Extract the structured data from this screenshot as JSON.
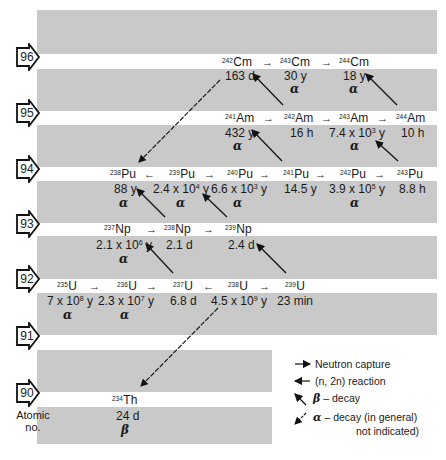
{
  "diagram": {
    "rows": [
      {
        "z": "96",
        "label_y": 43
      },
      {
        "z": "95",
        "label_y": 99
      },
      {
        "z": "94",
        "label_y": 155
      },
      {
        "z": "93",
        "label_y": 210
      },
      {
        "z": "92",
        "label_y": 265
      },
      {
        "z": "91",
        "label_y": 322
      },
      {
        "z": "90",
        "label_y": 379
      }
    ],
    "isotopes": {
      "cm242": {
        "mass": "242",
        "symbol": "Cm",
        "half_life": "163 d",
        "mode": ""
      },
      "cm243": {
        "mass": "243",
        "symbol": "Cm",
        "half_life": "30 y",
        "mode": "α"
      },
      "cm244": {
        "mass": "244",
        "symbol": "Cm",
        "half_life": "18 y",
        "mode": "α"
      },
      "am241": {
        "mass": "241",
        "symbol": "Am",
        "half_life": "432 y",
        "mode": "α"
      },
      "am242": {
        "mass": "242",
        "symbol": "Am",
        "half_life": "16 h",
        "mode": ""
      },
      "am243": {
        "mass": "243",
        "symbol": "Am",
        "half_life_base": "7.4 x 10",
        "half_life_exp": "3",
        "half_life_unit": " y",
        "mode": "α"
      },
      "am244": {
        "mass": "244",
        "symbol": "Am",
        "half_life": "10 h",
        "mode": ""
      },
      "pu238": {
        "mass": "238",
        "symbol": "Pu",
        "half_life": "88 y",
        "mode": "α"
      },
      "pu239": {
        "mass": "239",
        "symbol": "Pu",
        "half_life_base": "2.4 x 10",
        "half_life_exp": "4",
        "half_life_unit": " y",
        "mode": "α"
      },
      "pu240": {
        "mass": "240",
        "symbol": "Pu",
        "half_life_base": "6.6 x 10",
        "half_life_exp": "3",
        "half_life_unit": " y",
        "mode": "α"
      },
      "pu241": {
        "mass": "241",
        "symbol": "Pu",
        "half_life": "14.5 y",
        "mode": ""
      },
      "pu242": {
        "mass": "242",
        "symbol": "Pu",
        "half_life_base": "3.9 x 10",
        "half_life_exp": "5",
        "half_life_unit": " y",
        "mode": "α"
      },
      "pu243": {
        "mass": "243",
        "symbol": "Pu",
        "half_life": "8.8 h",
        "mode": ""
      },
      "np237": {
        "mass": "237",
        "symbol": "Np",
        "half_life_base": "2.1 x 10",
        "half_life_exp": "6",
        "half_life_unit": " y",
        "mode": "α"
      },
      "np238": {
        "mass": "238",
        "symbol": "Np",
        "half_life": "2.1 d",
        "mode": ""
      },
      "np239": {
        "mass": "239",
        "symbol": "Np",
        "half_life": "2.4 d",
        "mode": ""
      },
      "u235": {
        "mass": "235",
        "symbol": "U",
        "half_life_base": "7 x 10",
        "half_life_exp": "8",
        "half_life_unit": " y",
        "mode": "α"
      },
      "u236": {
        "mass": "236",
        "symbol": "U",
        "half_life_base": "2.3 x 10",
        "half_life_exp": "7",
        "half_life_unit": " y",
        "mode": "α"
      },
      "u237": {
        "mass": "237",
        "symbol": "U",
        "half_life": "6.8 d",
        "mode": ""
      },
      "u238": {
        "mass": "238",
        "symbol": "U",
        "half_life_base": "4.5 x 10",
        "half_life_exp": "9",
        "half_life_unit": " y",
        "mode": ""
      },
      "u239": {
        "mass": "239",
        "symbol": "U",
        "half_life": "23 min",
        "mode": ""
      },
      "th234": {
        "mass": "234",
        "symbol": "Th",
        "half_life": "24 d",
        "mode": "β"
      }
    },
    "arrows": {
      "right": "→",
      "left": "←"
    },
    "axis_label_line1": "Atomic",
    "axis_label_line2": "no."
  },
  "legend": {
    "neutron_capture": "Neutron capture",
    "n2n_reaction": "(n, 2n) reaction",
    "beta_symbol": "β",
    "beta_text": " – decay",
    "alpha_symbol": "α",
    "alpha_text": " – decay (in general)",
    "alpha_text2": "not indicated)"
  },
  "colors": {
    "band": "#c9c9c9",
    "ink": "#1a1a1a",
    "background": "#ffffff"
  }
}
